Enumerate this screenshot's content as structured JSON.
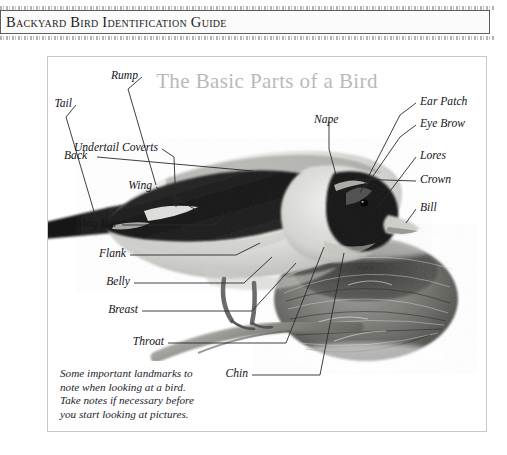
{
  "header": {
    "title": "Backyard Bird Identification Guide"
  },
  "figure": {
    "title": "The Basic Parts of a Bird",
    "caption": "Some important landmarks to\nnote when looking at a bird.\nTake notes if necessary before\nyou start looking at pictures.",
    "colors": {
      "title_gray": "#b9b9b9",
      "frame_gray": "#c9c9c9",
      "text_black": "#15151a",
      "leader_line": "#2a2a2a"
    },
    "labels_left": [
      {
        "text": "Rump"
      },
      {
        "text": "Tail"
      },
      {
        "text": "Undertail Coverts"
      },
      {
        "text": "Wing"
      },
      {
        "text": "Wing Bar"
      },
      {
        "text": "Flank"
      },
      {
        "text": "Belly"
      },
      {
        "text": "Breast"
      }
    ],
    "labels_right": [
      {
        "text": "Ear Patch"
      },
      {
        "text": "Eye Brow"
      },
      {
        "text": "Lores"
      },
      {
        "text": "Crown"
      },
      {
        "text": "Bill"
      }
    ],
    "labels_top": [
      {
        "text": "Back"
      },
      {
        "text": "Nape"
      }
    ],
    "labels_bottom": [
      {
        "text": "Throat"
      },
      {
        "text": "Chin"
      }
    ],
    "artwork": {
      "bird": "perched-finch-photo",
      "nest": "bird-nest-photo",
      "branch": "perch-branch"
    }
  }
}
